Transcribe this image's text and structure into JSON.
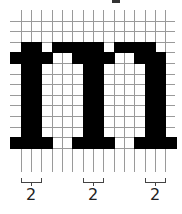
{
  "figure": {
    "glyph": "m",
    "grid": {
      "columns": 16,
      "rows": 14,
      "origin_x": 10.3,
      "origin_y": 10,
      "cell_width": 10.33,
      "cell_height": 10.6,
      "line_color": "#9a9a9a",
      "line_extend_bottom": 172
    },
    "fill_color": "#000000",
    "filled_rows": [
      {
        "row": 3,
        "spans": [
          [
            1,
            2
          ],
          [
            4,
            8
          ],
          [
            10,
            13
          ]
        ]
      },
      {
        "row": 4,
        "spans": [
          [
            0,
            3
          ],
          [
            6,
            9
          ],
          [
            12,
            14
          ]
        ]
      },
      {
        "row": 5,
        "spans": [
          [
            1,
            2
          ],
          [
            7,
            8
          ],
          [
            13,
            14
          ]
        ]
      },
      {
        "row": 6,
        "spans": [
          [
            1,
            2
          ],
          [
            7,
            8
          ],
          [
            13,
            14
          ]
        ]
      },
      {
        "row": 7,
        "spans": [
          [
            1,
            2
          ],
          [
            7,
            8
          ],
          [
            13,
            14
          ]
        ]
      },
      {
        "row": 8,
        "spans": [
          [
            1,
            2
          ],
          [
            7,
            8
          ],
          [
            13,
            14
          ]
        ]
      },
      {
        "row": 9,
        "spans": [
          [
            1,
            2
          ],
          [
            7,
            8
          ],
          [
            13,
            14
          ]
        ]
      },
      {
        "row": 10,
        "spans": [
          [
            1,
            2
          ],
          [
            7,
            8
          ],
          [
            13,
            14
          ]
        ]
      },
      {
        "row": 11,
        "spans": [
          [
            1,
            2
          ],
          [
            7,
            8
          ],
          [
            13,
            14
          ]
        ]
      },
      {
        "row": 12,
        "spans": [
          [
            0,
            3
          ],
          [
            6,
            9
          ],
          [
            12,
            15
          ]
        ]
      }
    ],
    "measurements": [
      {
        "label": "2",
        "from_col": 1,
        "to_col": 2
      },
      {
        "label": "2",
        "from_col": 7,
        "to_col": 8
      },
      {
        "label": "2",
        "from_col": 13,
        "to_col": 14
      }
    ]
  }
}
